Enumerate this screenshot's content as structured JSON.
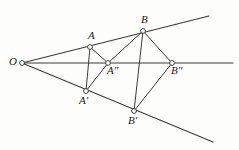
{
  "figure": {
    "type": "geometry-diagram",
    "width": 239,
    "height": 150,
    "background_color": "#fdfdfc",
    "line_color": "#3a3a3a",
    "vertex_fill": "#ffffff",
    "label_color": "#1a1a1a",
    "center": {
      "name": "O",
      "label": "O",
      "x": 22,
      "y": 63
    },
    "points": [
      {
        "name": "A",
        "label": "A",
        "x": 90,
        "y": 47,
        "label_x": 88,
        "label_y": 30
      },
      {
        "name": "B",
        "label": "B",
        "x": 143,
        "y": 31,
        "label_x": 141,
        "label_y": 14
      },
      {
        "name": "A2",
        "label": "A",
        "prime": "″",
        "x": 108,
        "y": 63,
        "label_x": 107,
        "label_y": 65
      },
      {
        "name": "B2",
        "label": "B",
        "prime": "″",
        "x": 172,
        "y": 63,
        "label_x": 171,
        "label_y": 65
      },
      {
        "name": "A1",
        "label": "A",
        "prime": "′",
        "x": 86,
        "y": 91,
        "label_x": 78,
        "label_y": 94
      },
      {
        "name": "B1",
        "label": "B",
        "prime": "′",
        "x": 134,
        "y": 111,
        "label_x": 127,
        "label_y": 114
      }
    ],
    "rays": [
      {
        "name": "ray-upper",
        "from": [
          22,
          63
        ],
        "to": [
          209,
          16
        ]
      },
      {
        "name": "ray-middle",
        "from": [
          22,
          63
        ],
        "to": [
          233,
          63
        ]
      },
      {
        "name": "ray-lower",
        "from": [
          22,
          63
        ],
        "to": [
          213,
          142
        ]
      }
    ],
    "segments": [
      {
        "name": "segment-A-A2",
        "from": [
          90,
          47
        ],
        "to": [
          108,
          63
        ]
      },
      {
        "name": "segment-A-A1",
        "from": [
          90,
          47
        ],
        "to": [
          86,
          91
        ]
      },
      {
        "name": "segment-A1-A2",
        "from": [
          86,
          91
        ],
        "to": [
          108,
          63
        ]
      },
      {
        "name": "segment-A2-B",
        "from": [
          108,
          63
        ],
        "to": [
          143,
          31
        ]
      },
      {
        "name": "segment-B-B2",
        "from": [
          143,
          31
        ],
        "to": [
          172,
          63
        ]
      },
      {
        "name": "segment-B-B1",
        "from": [
          143,
          31
        ],
        "to": [
          134,
          111
        ]
      },
      {
        "name": "segment-B1-B2",
        "from": [
          134,
          111
        ],
        "to": [
          172,
          63
        ]
      }
    ]
  }
}
